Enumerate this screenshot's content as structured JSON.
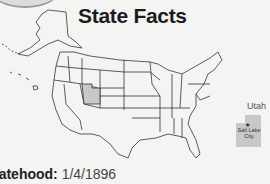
{
  "page": {
    "title": "State Facts"
  },
  "map": {
    "highlighted_state": "Utah",
    "highlight_color": "#c8c8c8",
    "inset": {
      "label": "Utah",
      "capital": "Salt Lake City",
      "capital_line1": "Salt Lake",
      "capital_line2": "City",
      "capital_marker": "★"
    }
  },
  "facts": {
    "statehood_label": "tatehood:",
    "statehood_value": "1/4/1896"
  }
}
